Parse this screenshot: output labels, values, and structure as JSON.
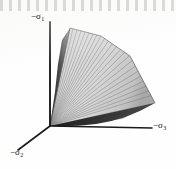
{
  "figure": {
    "kind": "3d-yield-surface-cone",
    "background_color": "#fefefe",
    "axis_color": "#1a1a1a",
    "surface_light_color": "#d2d2d2",
    "surface_mid_color": "#b4b4b4",
    "surface_dark_color": "#2a2a2a",
    "ruling_color": "#6e6e6e"
  },
  "axes": [
    {
      "id": "sigma1",
      "label_minus": "−σ",
      "label_sub": "1",
      "direction": "up"
    },
    {
      "id": "sigma2",
      "label_minus": "−σ",
      "label_sub": "2",
      "direction": "lower-left"
    },
    {
      "id": "sigma3",
      "label_minus": "−σ",
      "label_sub": "3",
      "direction": "right"
    }
  ],
  "geometry": {
    "origin": {
      "x": 50,
      "y": 126
    },
    "axis_sigma1_end": {
      "x": 50,
      "y": 22
    },
    "axis_sigma2_end": {
      "x": 18,
      "y": 150
    },
    "axis_sigma3_end": {
      "x": 152,
      "y": 128
    },
    "cone_apex": {
      "x": 50,
      "y": 126
    },
    "cone_rim_top": {
      "x": 70,
      "y": 28
    },
    "cone_rim_right": {
      "x": 155,
      "y": 103
    },
    "ruling_count": 34
  }
}
